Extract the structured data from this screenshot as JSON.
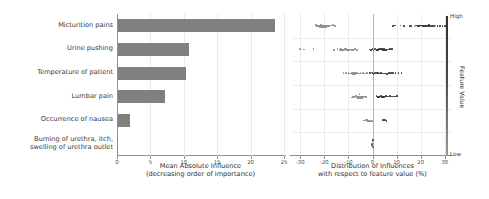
{
  "features": [
    "Micturition pains",
    "Urine pushing",
    "Temperature of patient",
    "Lumbar pain",
    "Occurrence of nausea",
    "Burning of urethra, itch,\nswelling of urethra outlet"
  ],
  "left_axis": {
    "title": "Mean Absolute Influence\n(decreasing order of importance)",
    "ticks": [
      "0",
      "5",
      "10",
      "15",
      "20",
      "25"
    ]
  },
  "right_axis": {
    "title": "Distribution of Influences\nwith respect to feature value (%)",
    "ticks": [
      "-30",
      "-20",
      "-10",
      "0",
      "10",
      "20",
      "30"
    ]
  },
  "colorbar": {
    "title": "Feature Value",
    "high_label": "High",
    "low_label": "Low",
    "high_color": "#2e2e2e",
    "low_color": "#9a9a9a"
  },
  "colors": {
    "bar": "#808080",
    "dot": "#3a3a3a",
    "grid": "#ebebeb",
    "axis": "#8f8f8f"
  },
  "chart_data": [
    {
      "type": "bar",
      "title": "",
      "xlabel": "Mean Absolute Influence (decreasing order of importance)",
      "ylabel": "",
      "orientation": "horizontal",
      "xlim": [
        0,
        25
      ],
      "grid": true,
      "categories": [
        "Micturition pains",
        "Urine pushing",
        "Temperature of patient",
        "Lumbar pain",
        "Occurrence of nausea",
        "Burning of urethra, itch, swelling of urethra outlet"
      ],
      "values": [
        23.5,
        10.7,
        10.2,
        7.0,
        1.8,
        0.0
      ]
    },
    {
      "type": "scatter",
      "subtype": "beeswarm",
      "title": "",
      "xlabel": "Distribution of Influences with respect to feature value (%)",
      "ylabel": "",
      "xlim": [
        -33,
        33
      ],
      "grid": true,
      "legend": {
        "position": "right",
        "type": "colorbar",
        "label": "Feature Value",
        "ticks": [
          "High",
          "Low"
        ]
      },
      "series": [
        {
          "name": "Micturition pains",
          "x": [
            -23.5,
            -23,
            -22.6,
            -22.2,
            -22,
            -21.8,
            -21.5,
            -21.2,
            -21,
            -20.8,
            -20.5,
            -20.2,
            -20,
            -19.8,
            -19.5,
            -19.2,
            -19,
            -18.6,
            -18.2,
            -17.8,
            -17.4,
            -17,
            -16.4,
            -15.6,
            8.5,
            9.2,
            11.6,
            13.2,
            15.5,
            16.2,
            17.4,
            18.2,
            18.8,
            19.4,
            19.8,
            20.2,
            20.6,
            21,
            21.4,
            21.8,
            22.2,
            22.6,
            23,
            23.4,
            24,
            24.6,
            25.4,
            26.2,
            27,
            28,
            29,
            30
          ],
          "value": [
            0.1,
            0.1,
            0.1,
            0.1,
            0.1,
            0.1,
            0.1,
            0.1,
            0.15,
            0.15,
            0.15,
            0.15,
            0.15,
            0.1,
            0.1,
            0.1,
            0.1,
            0.1,
            0.15,
            0.1,
            0.1,
            0.1,
            0.1,
            0.1,
            0.9,
            0.9,
            0.9,
            0.9,
            0.85,
            0.9,
            0.9,
            0.9,
            0.95,
            0.9,
            0.95,
            0.9,
            0.95,
            0.9,
            0.95,
            0.9,
            0.9,
            0.9,
            0.95,
            0.9,
            0.9,
            0.9,
            0.9,
            0.9,
            0.9,
            0.9,
            0.9,
            0.9
          ]
        },
        {
          "name": "Urine pushing",
          "x": [
            -30,
            -28.5,
            -24.5,
            -16,
            -14.5,
            -13.5,
            -13,
            -12.6,
            -12.2,
            -12,
            -11.7,
            -11.4,
            -11.1,
            -10.8,
            -10.5,
            -10.2,
            -10,
            -9.7,
            -9.4,
            -9,
            -8.5,
            -8,
            -7.2,
            -6.4,
            -1.2,
            -0.6,
            0,
            0.4,
            0.8,
            1.2,
            1.6,
            2,
            2.4,
            2.8,
            3.2,
            3.6,
            4,
            4.4,
            4.8,
            5.2,
            5.6,
            6,
            6.6,
            7.2,
            8
          ],
          "value": [
            0.1,
            0.1,
            0.1,
            0.1,
            0.15,
            0.1,
            0.1,
            0.15,
            0.1,
            0.15,
            0.1,
            0.15,
            0.1,
            0.15,
            0.1,
            0.15,
            0.1,
            0.1,
            0.1,
            0.1,
            0.1,
            0.1,
            0.1,
            0.1,
            0.85,
            0.9,
            0.9,
            0.9,
            0.95,
            0.9,
            0.95,
            0.9,
            0.95,
            0.9,
            0.95,
            0.9,
            0.95,
            0.9,
            0.95,
            0.9,
            0.9,
            0.9,
            0.9,
            0.9,
            0.9
          ]
        },
        {
          "name": "Temperature of patient",
          "x": [
            -12,
            -11,
            -10,
            -9.4,
            -9,
            -8.6,
            -8.2,
            -8,
            -7.8,
            -7.6,
            -7.4,
            -7.2,
            -7,
            -6.6,
            -6.2,
            -5.6,
            -5,
            -4,
            -3,
            -2.2,
            -1,
            -0.4,
            0,
            0.4,
            0.8,
            1.2,
            1.6,
            2,
            2.4,
            2.8,
            3.2,
            3.6,
            4,
            4.6,
            5.2,
            6,
            6.8,
            7.6,
            8.6,
            9.6,
            10.8,
            12
          ],
          "value": [
            0.1,
            0.1,
            0.15,
            0.1,
            0.15,
            0.1,
            0.15,
            0.1,
            0.15,
            0.1,
            0.15,
            0.1,
            0.15,
            0.1,
            0.1,
            0.1,
            0.1,
            0.1,
            0.1,
            0.1,
            0.85,
            0.9,
            0.9,
            0.95,
            0.9,
            0.95,
            0.9,
            0.95,
            0.9,
            0.95,
            0.9,
            0.95,
            0.9,
            0.9,
            0.9,
            0.9,
            0.9,
            0.9,
            0.9,
            0.9,
            0.9,
            0.9
          ]
        },
        {
          "name": "Lumbar pain",
          "x": [
            -8.5,
            -8,
            -7.6,
            -7.2,
            -6.8,
            -6.5,
            -6.2,
            -6,
            -5.8,
            -5.6,
            -5.4,
            -5.2,
            -5,
            -4.8,
            -4.6,
            -4.4,
            -4.2,
            -4,
            -3.6,
            -3.2,
            -2.6,
            1.6,
            2.2,
            2.8,
            3.2,
            3.6,
            4,
            4.4,
            4.8,
            5.2,
            5.6,
            6,
            6.6,
            7.2,
            7.8,
            8.6,
            9.4,
            10.2
          ],
          "value": [
            0.1,
            0.15,
            0.1,
            0.15,
            0.1,
            0.15,
            0.1,
            0.15,
            0.1,
            0.15,
            0.1,
            0.15,
            0.1,
            0.15,
            0.1,
            0.15,
            0.1,
            0.1,
            0.1,
            0.1,
            0.1,
            0.9,
            0.9,
            0.95,
            0.9,
            0.95,
            0.9,
            0.95,
            0.9,
            0.95,
            0.9,
            0.95,
            0.9,
            0.9,
            0.9,
            0.9,
            0.9,
            0.9
          ]
        },
        {
          "name": "Occurrence of nausea",
          "x": [
            -3.4,
            -2.8,
            -2.4,
            -2,
            -1.8,
            -1.6,
            -1.4,
            -1.2,
            -1,
            -0.8,
            -0.6,
            -0.4,
            -0.2,
            0,
            4.4,
            5.2,
            5.8
          ],
          "value": [
            0.1,
            0.1,
            0.15,
            0.1,
            0.15,
            0.1,
            0.15,
            0.1,
            0.15,
            0.1,
            0.15,
            0.1,
            0.15,
            0.1,
            0.9,
            0.9,
            0.9
          ]
        },
        {
          "name": "Burning of urethra, itch, swelling of urethra outlet",
          "x": [
            -0.2,
            -0.1,
            0,
            0,
            0,
            0.1,
            0.2
          ],
          "value": [
            0.3,
            0.5,
            0.5,
            0.5,
            0.5,
            0.5,
            0.7
          ]
        }
      ]
    }
  ]
}
